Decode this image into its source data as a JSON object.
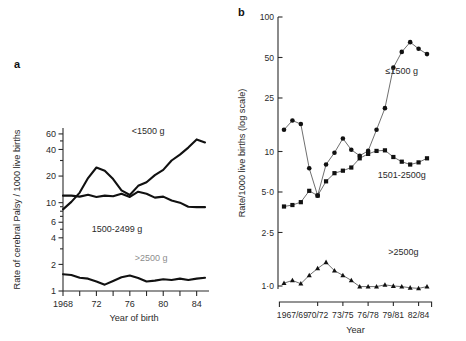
{
  "figure": {
    "panels": [
      {
        "letter": "a",
        "ylabel": "Rate of cerebral Palsy / 1000 live births",
        "xlabel": "Year of birth"
      },
      {
        "letter": "b",
        "ylabel": "Rate/1000 live births (log scale)",
        "xlabel": "Year"
      }
    ]
  },
  "chart_data": [
    {
      "type": "line",
      "panel": "a",
      "title": "",
      "xlabel": "Year of birth",
      "ylabel": "Rate of cerebral Palsy / 1000 live births",
      "yscale": "log",
      "ylim": [
        1,
        70
      ],
      "yticks": [
        1,
        2,
        4,
        6,
        10,
        20,
        40,
        60
      ],
      "ytick_labels": [
        "1",
        "2",
        "4",
        "6",
        "10",
        "20",
        "40",
        "60"
      ],
      "xlim": [
        1968,
        1985
      ],
      "xticks": [
        1968,
        1970,
        1972,
        1974,
        1976,
        1978,
        1980,
        1982,
        1984
      ],
      "xtick_labels": [
        "1968",
        "",
        "72",
        "",
        "76",
        "",
        "80",
        "",
        "84"
      ],
      "grid": false,
      "legend_position": "inline-annotations",
      "x": [
        1968,
        1969,
        1970,
        1971,
        1972,
        1973,
        1974,
        1975,
        1976,
        1977,
        1978,
        1979,
        1980,
        1981,
        1982,
        1983,
        1984,
        1985
      ],
      "series": [
        {
          "name": "<1500 g",
          "marker": "none",
          "values": [
            8.4,
            10.2,
            13.0,
            19.0,
            25.0,
            23.0,
            18.5,
            13.8,
            12.2,
            15.5,
            17.0,
            20.5,
            23.5,
            30.0,
            35.0,
            42.0,
            52.0,
            48.0
          ]
        },
        {
          "name": "1500-2499 g",
          "marker": "none",
          "values": [
            12.0,
            12.0,
            11.7,
            12.3,
            11.6,
            12.0,
            11.8,
            12.6,
            11.6,
            13.3,
            12.6,
            11.4,
            11.7,
            10.6,
            10.0,
            9.0,
            8.9,
            8.9
          ]
        },
        {
          "name": ">2500 g",
          "marker": "none",
          "values": [
            1.55,
            1.52,
            1.41,
            1.38,
            1.28,
            1.18,
            1.3,
            1.43,
            1.5,
            1.4,
            1.28,
            1.31,
            1.36,
            1.33,
            1.38,
            1.33,
            1.38,
            1.41
          ]
        }
      ],
      "annotations": [
        {
          "text": "<1500 g",
          "x_frac": 0.6,
          "y_value": 60
        },
        {
          "text": "1500-2499 g",
          "x_frac": 0.38,
          "y_value": 4.6
        },
        {
          "text": ">2500 g",
          "x_frac": 0.62,
          "y_value": 2.2
        }
      ]
    },
    {
      "type": "line",
      "panel": "b",
      "title": "",
      "xlabel": "Year",
      "ylabel": "Rate/1000 live births (log scale)",
      "yscale": "log",
      "ylim": [
        0.95,
        100
      ],
      "yticks": [
        1.0,
        2.5,
        5.0,
        10,
        25,
        50,
        100
      ],
      "ytick_labels": [
        "1·0",
        "2·5",
        "5·0",
        "10",
        "25",
        "50",
        "100"
      ],
      "xtick_labels": [
        "1967/69",
        "70/72",
        "73/75",
        "76/78",
        "79/81",
        "82/84"
      ],
      "grid": false,
      "legend_position": "inline-annotations",
      "x_index": [
        0,
        1,
        2,
        3,
        4,
        5,
        6,
        7,
        8,
        9,
        10,
        11,
        12,
        13,
        14,
        15,
        16,
        17
      ],
      "series": [
        {
          "name": "≤1500 g",
          "marker": "circle",
          "values": [
            14.5,
            17.0,
            16.0,
            7.5,
            4.7,
            8.0,
            9.8,
            12.5,
            10.3,
            9.3,
            10.1,
            14.5,
            21.0,
            42.0,
            55.0,
            65.0,
            58.0,
            53.0
          ]
        },
        {
          "name": "1501-2500g",
          "marker": "square",
          "values": [
            3.9,
            4.0,
            4.2,
            5.1,
            4.7,
            6.0,
            6.9,
            7.2,
            7.6,
            8.9,
            9.6,
            10.1,
            10.2,
            9.1,
            8.4,
            8.0,
            8.3,
            8.9
          ]
        },
        {
          "name": ">2500g",
          "marker": "triangle",
          "values": [
            1.05,
            1.1,
            1.04,
            1.2,
            1.35,
            1.5,
            1.3,
            1.2,
            1.1,
            0.99,
            0.99,
            0.99,
            1.02,
            1.0,
            0.99,
            0.97,
            0.96,
            0.99
          ]
        }
      ],
      "annotations": [
        {
          "text": "≤1500 g",
          "x_index": 14.0,
          "y_value": 38
        },
        {
          "text": "1501-2500g",
          "x_index": 14.0,
          "y_value": 6.3
        },
        {
          "text": ">2500g",
          "x_index": 14.2,
          "y_value": 1.7
        }
      ]
    }
  ]
}
